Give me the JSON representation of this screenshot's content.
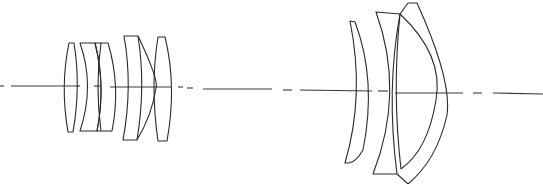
{
  "diagram": {
    "type": "optical-lens-cross-section",
    "background": "#ffffff",
    "line_color": "#2a2a2a",
    "optical_axis": {
      "y": 87,
      "segments": [
        [
          0,
          4
        ],
        [
          12,
          220
        ],
        [
          229,
          244
        ],
        [
          256,
          328
        ],
        [
          339,
          350
        ],
        [
          360,
          462
        ],
        [
          474,
          483
        ],
        [
          494,
          543
        ]
      ]
    },
    "front_group": {
      "label": "front lens group",
      "element_count": 6
    },
    "rear_group": {
      "label": "rear lens group",
      "element_count": 4
    }
  }
}
